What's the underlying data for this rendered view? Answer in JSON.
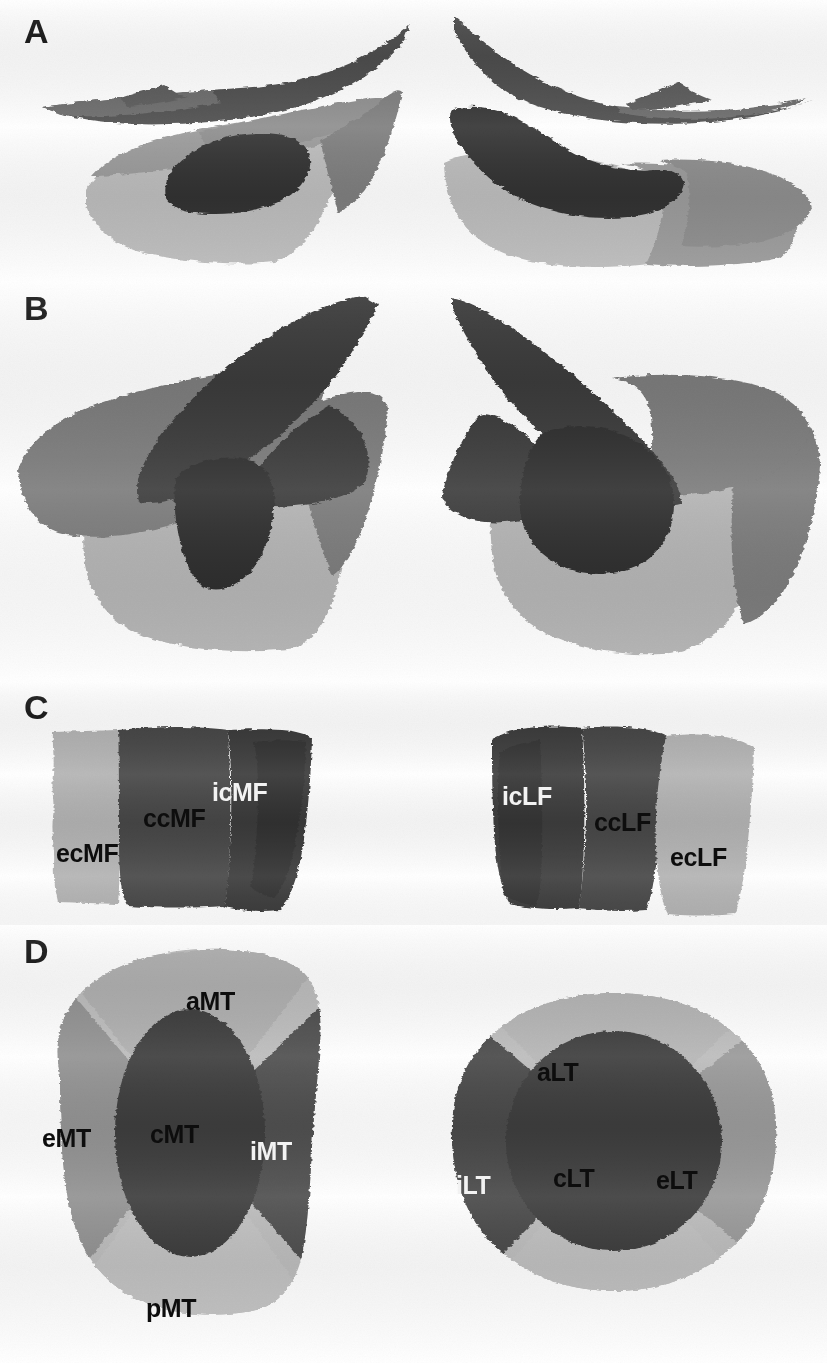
{
  "figure": {
    "background_color": "#ffffff",
    "width": 827,
    "height": 1363
  },
  "palette": {
    "light_gray": "#b9b9b9",
    "mid_light_gray": "#a3a3a3",
    "mid_gray": "#8c8c8c",
    "dark_gray": "#585858",
    "darker_gray": "#4a4a4a",
    "near_black": "#2e2e2e",
    "black_text": "#0d0d0d",
    "white_text": "#f4f4f4"
  },
  "panels": [
    {
      "id": "panel-a",
      "letter": "A",
      "description": "Sagittal view of femoral and tibial cartilage plates, medial (left) and lateral (right)",
      "labels": []
    },
    {
      "id": "panel-b",
      "letter": "B",
      "description": "Oblique view of femoral and tibial cartilage plates, medial (left) and lateral (right)",
      "labels": []
    },
    {
      "id": "panel-c",
      "letter": "C",
      "description": "Femoral cartilage plate subregions, medial (left) and lateral (right)",
      "labels": [
        {
          "text": "ecMF",
          "side": "medial",
          "tone": "dark",
          "x": 106,
          "y": 862
        },
        {
          "text": "ccMF",
          "side": "medial",
          "tone": "dark",
          "x": 193,
          "y": 827
        },
        {
          "text": "icMF",
          "side": "medial",
          "tone": "light",
          "x": 262,
          "y": 801
        },
        {
          "text": "icLF",
          "side": "lateral",
          "tone": "light",
          "x": 512,
          "y": 805
        },
        {
          "text": "ccLF",
          "side": "lateral",
          "tone": "dark",
          "x": 604,
          "y": 831
        },
        {
          "text": "ecLF",
          "side": "lateral",
          "tone": "dark",
          "x": 680,
          "y": 866
        }
      ]
    },
    {
      "id": "panel-d",
      "letter": "D",
      "description": "Tibial cartilage plate subregions, medial (left) and lateral (right)",
      "labels": [
        {
          "text": "aMT",
          "side": "medial",
          "tone": "dark",
          "x": 219,
          "y": 1002
        },
        {
          "text": "eMT",
          "side": "medial",
          "tone": "dark",
          "x": 75,
          "y": 1139
        },
        {
          "text": "cMT",
          "side": "medial",
          "tone": "dark",
          "x": 182,
          "y": 1135
        },
        {
          "text": "iMT",
          "side": "medial",
          "tone": "light",
          "x": 277,
          "y": 1152
        },
        {
          "text": "pMT",
          "side": "medial",
          "tone": "dark",
          "x": 176,
          "y": 1309
        },
        {
          "text": "aLT",
          "side": "lateral",
          "tone": "dark",
          "x": 564,
          "y": 1073
        },
        {
          "text": "iLT",
          "side": "lateral",
          "tone": "light",
          "x": 470,
          "y": 1186
        },
        {
          "text": "cLT",
          "side": "lateral",
          "tone": "dark",
          "x": 582,
          "y": 1179
        },
        {
          "text": "eLT",
          "side": "lateral",
          "tone": "dark",
          "x": 685,
          "y": 1181
        }
      ]
    }
  ],
  "legend_keys": {
    "ecMF": "external central medial femoral",
    "ccMF": "central central medial femoral",
    "icMF": "internal central medial femoral",
    "icLF": "internal central lateral femoral",
    "ccLF": "central central lateral femoral",
    "ecLF": "external central lateral femoral",
    "aMT": "anterior medial tibial",
    "eMT": "external medial tibial",
    "cMT": "central medial tibial",
    "iMT": "internal medial tibial",
    "pMT": "posterior medial tibial",
    "aLT": "anterior lateral tibial",
    "iLT": "internal lateral tibial",
    "cLT": "central lateral tibial",
    "eLT": "external lateral tibial",
    "pLT": "posterior lateral tibial"
  }
}
